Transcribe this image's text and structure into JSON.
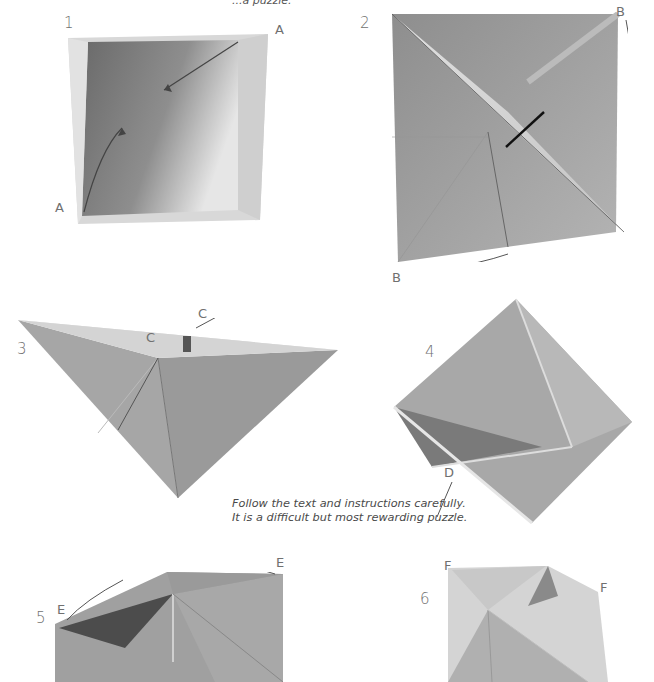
{
  "page": {
    "top_fragment": "...a puzzle.",
    "caption": {
      "line1": "Follow the text and instructions carefully.",
      "line2": "It is a difficult but most rewarding puzzle."
    },
    "colors": {
      "background": "#ffffff",
      "paper_mid": "#a8a8a8",
      "paper_light": "#d6d6d6",
      "paper_dark": "#6e6e6e",
      "label_text": "#707070"
    }
  },
  "steps": [
    {
      "number": "1",
      "labels": [
        "A",
        "A"
      ],
      "description": "Square box, open view; arrow from corner A to corner A"
    },
    {
      "number": "2",
      "labels": [
        "B",
        "B"
      ],
      "description": "Flattened square with diagonal fold; curved arrows at corners B"
    },
    {
      "number": "3",
      "labels": [
        "C",
        "C"
      ],
      "description": "Pyramid form; arrows pull out points C"
    },
    {
      "number": "4",
      "labels": [
        "D"
      ],
      "description": "Diamond form with inner pocket; arrow at D"
    },
    {
      "number": "5",
      "labels": [
        "E",
        "E"
      ],
      "description": "Partially opened form; curved arrows at E"
    },
    {
      "number": "6",
      "labels": [
        "F",
        "F"
      ],
      "description": "Box top twisting open; arrows outward at F"
    }
  ]
}
